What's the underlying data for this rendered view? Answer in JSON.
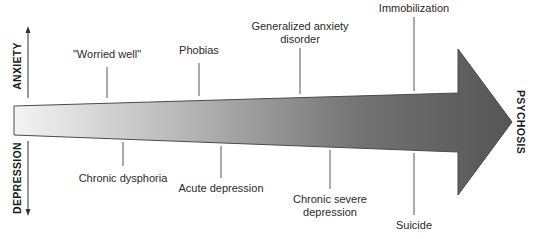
{
  "diagram": {
    "axes": {
      "up_label": "ANXIETY",
      "down_label": "DEPRESSION",
      "end_label": "PSYCHOSIS"
    },
    "arrow": {
      "gradient_start": "#f2f2f2",
      "gradient_end": "#555555",
      "outline": "#444444"
    },
    "anxiety_items": [
      {
        "label": "\"Worried well\""
      },
      {
        "label": "Phobias"
      },
      {
        "label_line1": "Generalized anxiety",
        "label_line2": "disorder"
      },
      {
        "label": "Immobilization"
      }
    ],
    "depression_items": [
      {
        "label": "Chronic dysphoria"
      },
      {
        "label": "Acute depression"
      },
      {
        "label_line1": "Chronic severe",
        "label_line2": "depression"
      },
      {
        "label": "Suicide"
      }
    ]
  }
}
